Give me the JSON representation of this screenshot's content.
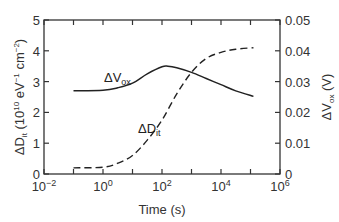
{
  "chart_data": {
    "type": "line",
    "title": "",
    "xlabel": "Time (s)",
    "ylabel": "ΔD_it (10^10 eV^-1 cm^-2)",
    "ylabel_right": "ΔV_ox (V)",
    "xscale": "log",
    "xlim": [
      0.01,
      1000000
    ],
    "ylim": [
      0,
      5
    ],
    "ylim_right": [
      0,
      0.05
    ],
    "grid": false,
    "legend": "inline labels",
    "x_ticks": [
      "10^-2",
      "10^0",
      "10^2",
      "10^4",
      "10^6"
    ],
    "y_ticks_left": [
      "0",
      "1",
      "2",
      "3",
      "4",
      "5"
    ],
    "y_ticks_right": [
      "0",
      "0.01",
      "0.02",
      "0.03",
      "0.04",
      "0.05"
    ],
    "series": [
      {
        "name": "ΔV_ox",
        "axis": "right",
        "style": "solid",
        "log10_x": [
          -1,
          0,
          0.5,
          1,
          1.5,
          2,
          2.2,
          2.5,
          3,
          3.5,
          4,
          4.5,
          5.1
        ],
        "values": [
          0.027,
          0.0272,
          0.028,
          0.0295,
          0.0325,
          0.0348,
          0.035,
          0.0345,
          0.033,
          0.031,
          0.029,
          0.027,
          0.0252
        ]
      },
      {
        "name": "ΔD_it",
        "axis": "left",
        "style": "dashed",
        "log10_x": [
          -1,
          0,
          0.5,
          1,
          1.5,
          2,
          2.5,
          3,
          3.5,
          4,
          4.5,
          5.1
        ],
        "values": [
          0.2,
          0.22,
          0.35,
          0.6,
          1.1,
          1.75,
          2.6,
          3.3,
          3.75,
          3.95,
          4.05,
          4.1
        ]
      }
    ]
  },
  "labels": {
    "xlabel": "Time (s)",
    "ylabel_left_main": "ΔD",
    "ylabel_left_sub": "it",
    "ylabel_left_rest": " (10",
    "ylabel_left_exp1": "10",
    "ylabel_left_mid": " eV",
    "ylabel_left_exp2": "−1",
    "ylabel_left_end": " cm",
    "ylabel_left_exp3": "−2",
    "ylabel_left_close": ")",
    "ylabel_right_main": "ΔV",
    "ylabel_right_sub": "ox",
    "ylabel_right_rest": " (V)",
    "series_vox_main": "ΔV",
    "series_vox_sub": "ox",
    "series_dit_main": "ΔD",
    "series_dit_sub": "it"
  }
}
